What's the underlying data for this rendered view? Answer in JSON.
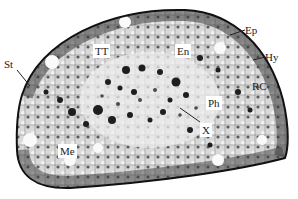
{
  "figure": {
    "colors": {
      "background": "#ffffff",
      "epidermis": "#1a1a1a",
      "tissue_dark": "#2a2a2a",
      "tissue_mid": "#8a8a8a",
      "tissue_light": "#e8e8e8"
    }
  },
  "labels": {
    "st": "St",
    "tt": "TT",
    "en": "En",
    "ep": "Ep",
    "hy": "Hy",
    "rc": "RC",
    "ph": "Ph",
    "x": "X",
    "me": "Me"
  }
}
